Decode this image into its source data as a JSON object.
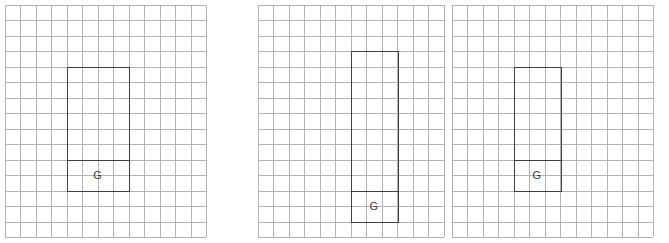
{
  "figure": {
    "panel_count": 3,
    "colors": {
      "background": "#ffffff",
      "grid_line": "#b3b3b3",
      "shape_stroke": "#404040",
      "label_text": "#3a3a3a"
    },
    "grid": {
      "cell_size_px": 15.5,
      "columns": 13,
      "rows": 15
    }
  },
  "panels": [
    {
      "id": "panel-1",
      "label": "Panel 1",
      "origin_x": 4,
      "width_px": 212,
      "height_px": 236,
      "columns": 13,
      "rows": 15,
      "shape": {
        "name": "rectangle-with-G-cell",
        "left_col": 4,
        "right_col": 8,
        "top_row": 4,
        "bottom_row": 12,
        "divider_row": 10,
        "cell_label": "G",
        "label_col_center": 6,
        "label_row_center": 11
      }
    },
    {
      "id": "panel-2",
      "label": "Panel 2",
      "origin_x": 257,
      "width_px": 196,
      "height_px": 236,
      "columns": 12,
      "rows": 15,
      "shape": {
        "name": "rectangle-with-G-cell",
        "left_col": 6,
        "right_col": 9,
        "top_row": 3,
        "bottom_row": 14,
        "divider_row": 12,
        "cell_label": "G",
        "label_col_center": 7.5,
        "label_row_center": 13
      }
    },
    {
      "id": "panel-3",
      "label": "Panel 3",
      "origin_x": 451,
      "width_px": 212,
      "height_px": 236,
      "columns": 13,
      "rows": 15,
      "shape": {
        "name": "rectangle-with-G-cell",
        "left_col": 4,
        "right_col": 7,
        "top_row": 4,
        "bottom_row": 12,
        "divider_row": 10,
        "cell_label": "G",
        "label_col_center": 5.5,
        "label_row_center": 11
      }
    }
  ]
}
